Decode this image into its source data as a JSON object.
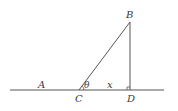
{
  "diagram": {
    "type": "geometry-right-triangle",
    "stroke_color": "#555555",
    "label_color": "#3a3a3a",
    "points": {
      "A": {
        "label": "A",
        "x": 41,
        "y": 90
      },
      "B": {
        "label": "B",
        "x": 130,
        "y": 22
      },
      "C": {
        "label": "C",
        "x": 79,
        "y": 90
      },
      "D": {
        "label": "D",
        "x": 130,
        "y": 90
      }
    },
    "labels": {
      "A": "A",
      "B": "B",
      "C": "C",
      "D": "D",
      "angle": "θ",
      "segment_CD": "x"
    },
    "baseline": {
      "x1": 10,
      "x2": 164,
      "y": 90
    },
    "right_angle_at": "D",
    "angle_at": "C"
  }
}
